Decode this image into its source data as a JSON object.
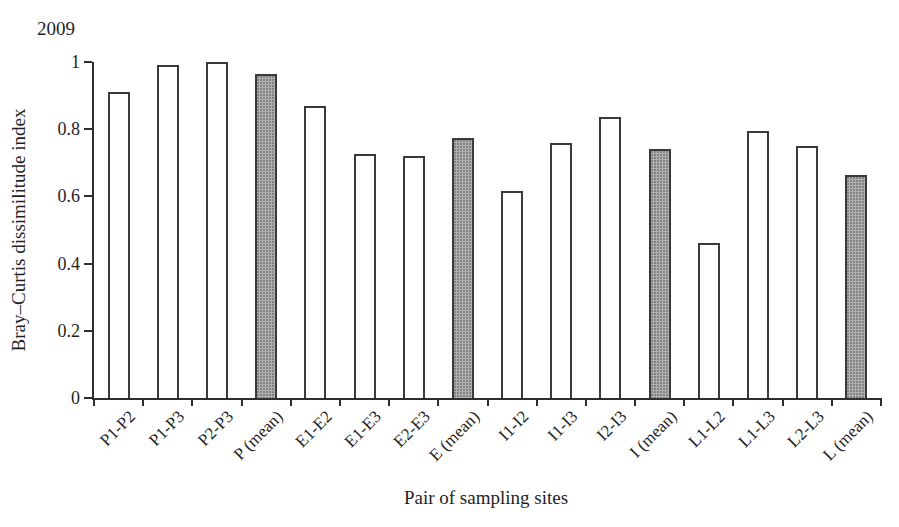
{
  "chart_data": {
    "type": "bar",
    "annotation": "2009",
    "title": "",
    "xlabel": "Pair of sampling sites",
    "ylabel": "Bray–Curtis dissimilitude index",
    "categories": [
      "P1-P2",
      "P1-P3",
      "P2-P3",
      "P (mean)",
      "E1-E2",
      "E1-E3",
      "E2-E3",
      "E (mean)",
      "I1-I2",
      "I1-I3",
      "I2-I3",
      "I (mean)",
      "L1-L2",
      "L1-L3",
      "L2-L3",
      "L (mean)"
    ],
    "values": [
      0.91,
      0.99,
      1.0,
      0.965,
      0.87,
      0.725,
      0.72,
      0.775,
      0.615,
      0.76,
      0.835,
      0.74,
      0.46,
      0.795,
      0.75,
      0.665
    ],
    "mean_flags": [
      false,
      false,
      false,
      true,
      false,
      false,
      false,
      true,
      false,
      false,
      false,
      true,
      false,
      false,
      false,
      true
    ],
    "ylim": [
      0,
      1
    ],
    "yticks": [
      0,
      0.2,
      0.4,
      0.6,
      0.8,
      1
    ],
    "grid": false,
    "legend": "none",
    "bar_series": [
      {
        "name": "site-pair",
        "fill": "#ffffff"
      },
      {
        "name": "group-mean",
        "fill": "#b0b0b0"
      }
    ],
    "colors": {
      "pair_bar_fill": "#ffffff",
      "mean_bar_fill": "#b0b0b0",
      "bar_border": "#3a3a3a",
      "axis": "#2e2e2e",
      "text": "#1f1f1f",
      "background": "#ffffff"
    }
  }
}
